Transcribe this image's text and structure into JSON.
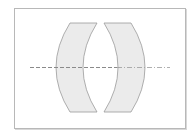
{
  "diagram": {
    "type": "optical-lens-diagram",
    "colors": {
      "frame_border": "#b8b8b8",
      "lens_fill": "#ebebeb",
      "lens_stroke": "#9a9a9a",
      "axis_stroke": "#8a8a8a",
      "background": "#ffffff"
    },
    "frame": {
      "x": 14,
      "y": 8,
      "width": 171,
      "height": 120
    },
    "optical_axis": {
      "y": 67,
      "x_start": 30,
      "x_end": 170,
      "style": "dashed"
    },
    "lenses": [
      {
        "name": "left-lens",
        "top_edge": {
          "x1": 70,
          "x2": 97,
          "y": 23
        },
        "bottom_edge": {
          "x1": 70,
          "x2": 97,
          "y": 112
        },
        "mid_extent": {
          "x1": 56,
          "x2": 83
        }
      },
      {
        "name": "right-lens",
        "top_edge": {
          "x1": 104,
          "x2": 131,
          "y": 23
        },
        "bottom_edge": {
          "x1": 104,
          "x2": 131,
          "y": 112
        },
        "mid_extent": {
          "x1": 117,
          "x2": 144
        }
      }
    ]
  }
}
